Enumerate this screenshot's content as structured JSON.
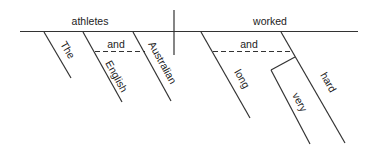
{
  "diagram": {
    "type": "sentence-diagram",
    "sentence_words": {
      "subject": "athletes",
      "verb": "worked",
      "subject_modifiers": [
        "The",
        "English",
        "Australian"
      ],
      "subject_conjunction": "and",
      "verb_modifiers": [
        "long",
        "hard"
      ],
      "verb_conjunction": "and",
      "adverb_modifier": "very"
    },
    "labels": {
      "subject": "athletes",
      "verb": "worked",
      "the": "The",
      "english": "English",
      "australian": "Australian",
      "and_subject": "and",
      "long": "long",
      "hard": "hard",
      "and_verb": "and",
      "very": "very"
    },
    "colors": {
      "line": "#333333",
      "text": "#222222",
      "background": "#ffffff"
    }
  }
}
